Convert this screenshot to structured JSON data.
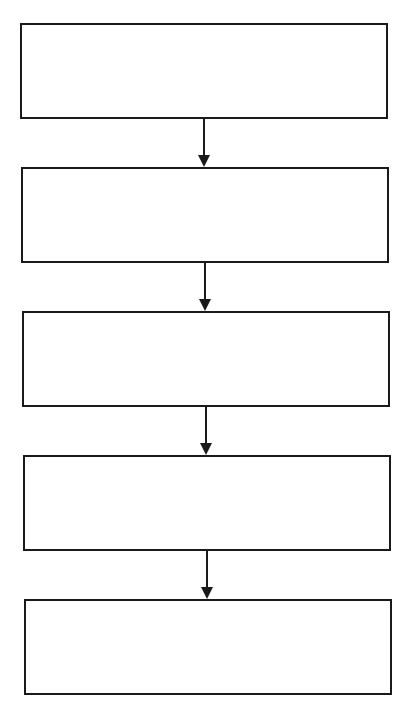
{
  "diagram": {
    "type": "flowchart",
    "direction": "top-to-bottom",
    "line_color": "#1a1a1a",
    "background": "#ffffff",
    "nodes": [
      {
        "id": "step-1",
        "label": ""
      },
      {
        "id": "step-2",
        "label": ""
      },
      {
        "id": "step-3",
        "label": ""
      },
      {
        "id": "step-4",
        "label": ""
      },
      {
        "id": "step-5",
        "label": ""
      }
    ],
    "edges": [
      {
        "from": "step-1",
        "to": "step-2"
      },
      {
        "from": "step-2",
        "to": "step-3"
      },
      {
        "from": "step-3",
        "to": "step-4"
      },
      {
        "from": "step-4",
        "to": "step-5"
      }
    ]
  }
}
